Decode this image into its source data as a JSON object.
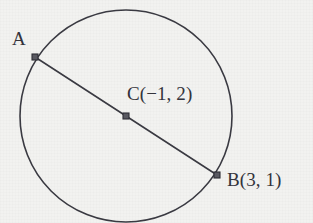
{
  "figure": {
    "kind": "circle-with-diameter",
    "width": 313,
    "height": 223,
    "background_color": "#f2f2f0",
    "stroke_color": "#3a3a42",
    "marker_fill_color": "#5a5a62",
    "text_color": "#33333b"
  },
  "circle": {
    "center_x": 126,
    "center_y": 116,
    "radius": 106,
    "stroke_width": 1.6
  },
  "segment": {
    "name": "diameter-ab",
    "stroke_width": 1.6,
    "from_x": 35,
    "from_y": 57,
    "to_x": 217,
    "to_y": 175
  },
  "points": [
    {
      "id": "a",
      "label": "A",
      "x": 35,
      "y": 57,
      "marker_size": 6
    },
    {
      "id": "c",
      "label": "C(−1, 2)",
      "x": 126,
      "y": 116,
      "marker_size": 6
    },
    {
      "id": "b",
      "label": "B(3, 1)",
      "x": 217,
      "y": 175,
      "marker_size": 6
    }
  ],
  "labels": {
    "a": "A",
    "c": "C(−1, 2)",
    "b": "B(3, 1)"
  },
  "chart_data": {
    "type": "scatter",
    "title": "",
    "xlabel": "",
    "ylabel": "",
    "annotations": [
      "A",
      "C(−1, 2)",
      "B(3, 1)"
    ],
    "shapes": [
      {
        "shape": "circle",
        "center_label": "C",
        "center": [
          -1,
          2
        ],
        "passes_through": [
          3,
          1
        ]
      },
      {
        "shape": "segment",
        "endpoints_labels": [
          "A",
          "B"
        ],
        "through_center_label": "C"
      }
    ],
    "points": [
      {
        "label": "A",
        "coords": null
      },
      {
        "label": "C",
        "coords": [
          -1,
          2
        ]
      },
      {
        "label": "B",
        "coords": [
          3,
          1
        ]
      }
    ]
  }
}
